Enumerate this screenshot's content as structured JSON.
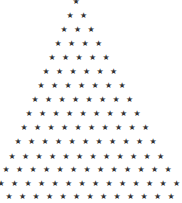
{
  "pattern": {
    "description": "Star pyramid pattern",
    "glyph": "★",
    "color": "#333333",
    "background": "#ffffff",
    "spacing_x": 13.5,
    "rows": [
      {
        "y": 2,
        "x0": 76,
        "count": 1
      },
      {
        "y": 16,
        "x0": 70,
        "count": 2
      },
      {
        "y": 30,
        "x0": 64,
        "count": 3
      },
      {
        "y": 44,
        "x0": 58,
        "count": 4
      },
      {
        "y": 58,
        "x0": 52,
        "count": 5
      },
      {
        "y": 72,
        "x0": 46,
        "count": 6
      },
      {
        "y": 86,
        "x0": 41,
        "count": 7
      },
      {
        "y": 100,
        "x0": 35,
        "count": 8
      },
      {
        "y": 114,
        "x0": 29,
        "count": 9
      },
      {
        "y": 128,
        "x0": 24,
        "count": 10
      },
      {
        "y": 142,
        "x0": 18,
        "count": 11
      },
      {
        "y": 157,
        "x0": 12,
        "count": 12
      },
      {
        "y": 170,
        "x0": 6,
        "count": 13
      },
      {
        "y": 184,
        "x0": 1,
        "count": 14
      },
      {
        "y": 197,
        "x0": 9,
        "count": 13
      }
    ]
  }
}
